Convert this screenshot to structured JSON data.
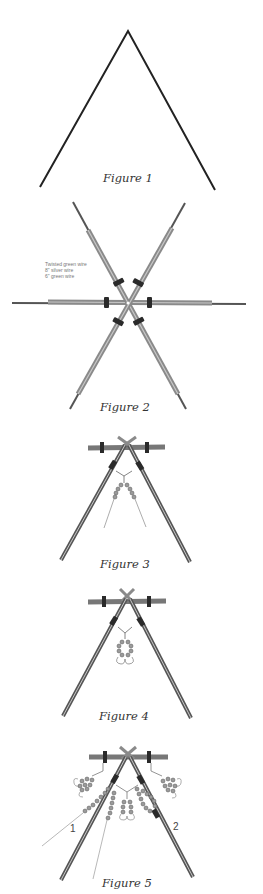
{
  "figures": [
    {
      "id": 1,
      "caption": "Figure 1"
    },
    {
      "id": 2,
      "caption": "Figure 2",
      "notes": [
        "Twisted green wire",
        "8\" silver wire",
        "6\" green wire"
      ]
    },
    {
      "id": 3,
      "caption": "Figure 3"
    },
    {
      "id": 4,
      "caption": "Figure 4"
    },
    {
      "id": 5,
      "caption": "Figure 5",
      "markers": [
        "1",
        "2"
      ]
    }
  ],
  "colors": {
    "line": "#222222",
    "wire_dark": "#555555",
    "wire_mid": "#8a8a8a",
    "wire_light": "#c8c8c8",
    "band": "#2a2a2a",
    "bead": "#9a9a9a"
  }
}
